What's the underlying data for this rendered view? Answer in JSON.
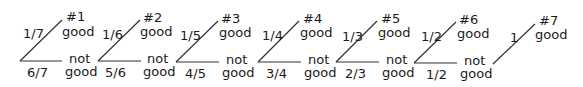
{
  "diagram": {
    "type": "probability-tree",
    "colors": {
      "line": "#333333",
      "text": "#1a1a1a",
      "background": "#ffffff"
    },
    "stages": [
      {
        "id": "#1",
        "p_good": "1/7",
        "p_not": "6/7",
        "good_label": "good",
        "not_label_1": "not",
        "not_label_2": "good"
      },
      {
        "id": "#2",
        "p_good": "1/6",
        "p_not": "5/6",
        "good_label": "good",
        "not_label_1": "not",
        "not_label_2": "good"
      },
      {
        "id": "#3",
        "p_good": "1/5",
        "p_not": "4/5",
        "good_label": "good",
        "not_label_1": "not",
        "not_label_2": "good"
      },
      {
        "id": "#4",
        "p_good": "1/4",
        "p_not": "3/4",
        "good_label": "good",
        "not_label_1": "not",
        "not_label_2": "good"
      },
      {
        "id": "#5",
        "p_good": "1/3",
        "p_not": "2/3",
        "good_label": "good",
        "not_label_1": "not",
        "not_label_2": "good"
      },
      {
        "id": "#6",
        "p_good": "1/2",
        "p_not": "1/2",
        "good_label": "good",
        "not_label_1": "not",
        "not_label_2": "good"
      },
      {
        "id": "#7",
        "p_good": "1",
        "good_label": "good"
      }
    ]
  }
}
